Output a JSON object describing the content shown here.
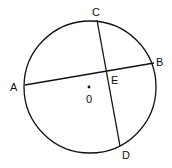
{
  "diagram": {
    "type": "circle-chords",
    "circle": {
      "cx": 90,
      "cy": 87,
      "r": 66,
      "center_label": "0"
    },
    "points": {
      "A": {
        "x": 25,
        "y": 85,
        "label": "A"
      },
      "B": {
        "x": 154,
        "y": 63,
        "label": "B"
      },
      "C": {
        "x": 97,
        "y": 20,
        "label": "C"
      },
      "D": {
        "x": 120,
        "y": 146,
        "label": "D"
      },
      "E": {
        "x": 106,
        "y": 71,
        "label": "E"
      }
    },
    "chords": [
      [
        "A",
        "B"
      ],
      [
        "C",
        "D"
      ]
    ],
    "stroke_color": "#111111"
  }
}
